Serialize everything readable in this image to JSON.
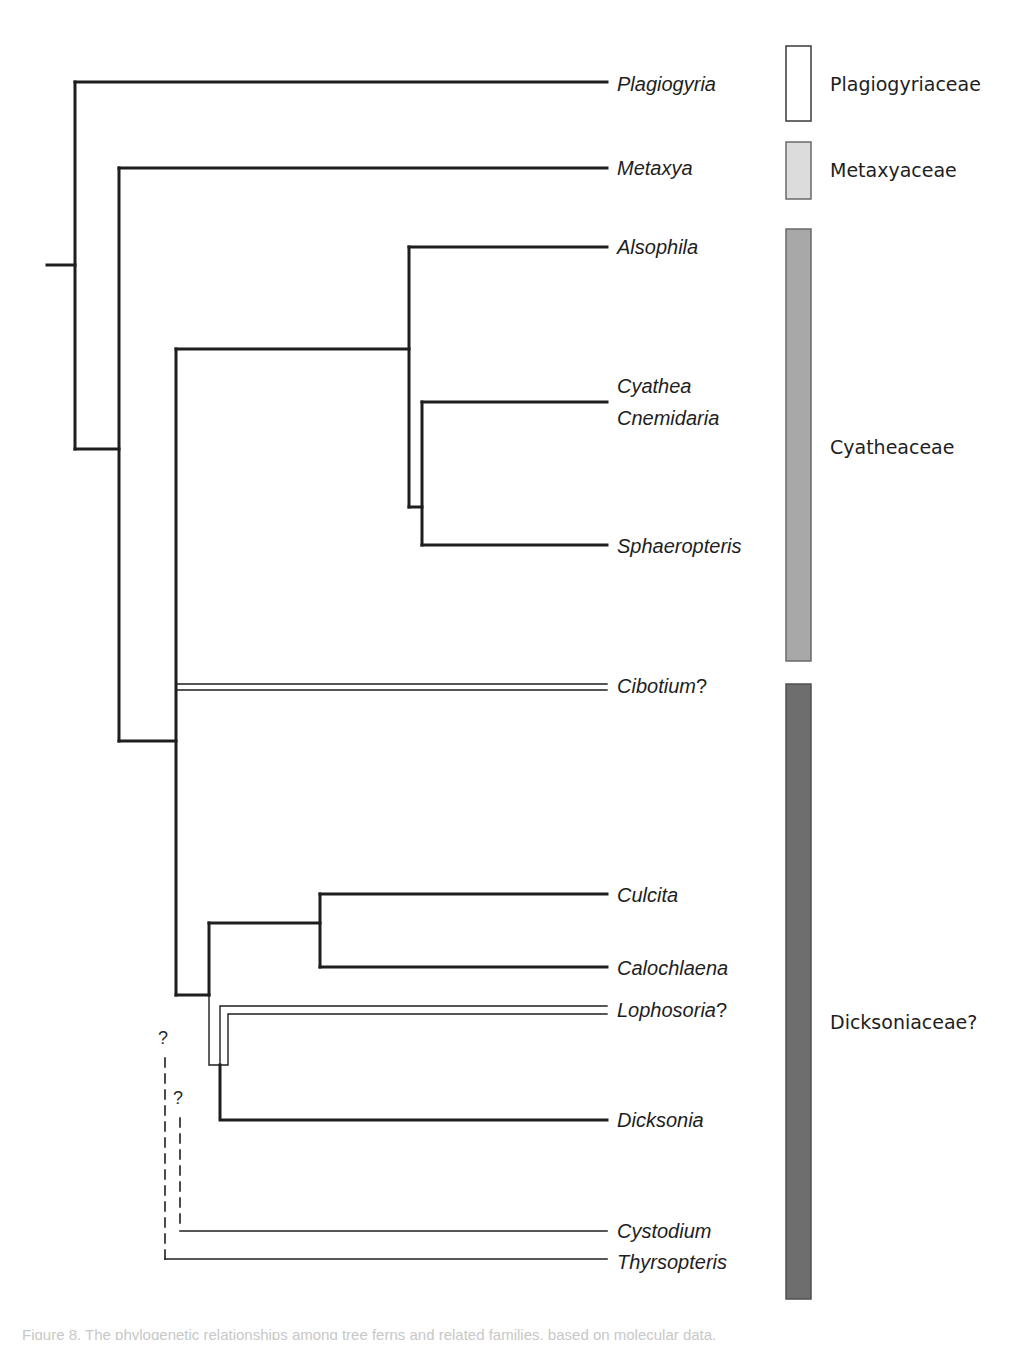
{
  "figure": {
    "type": "phylogenetic-tree",
    "line_color": "#1e1e1e",
    "background": "#ffffff"
  },
  "taxa": [
    {
      "id": "plagiogyria",
      "label": "Plagiogyria",
      "y": 84,
      "line_style": "solid-thick"
    },
    {
      "id": "metaxya",
      "label": "Metaxya",
      "y": 168,
      "line_style": "solid-thick"
    },
    {
      "id": "alsophila",
      "label": "Alsophila",
      "y": 247,
      "line_style": "solid-thick"
    },
    {
      "id": "cyathea",
      "label": "Cyathea",
      "y": 386,
      "line_style": "solid-thick"
    },
    {
      "id": "cnemidaria",
      "label": "Cnemidaria",
      "y": 418,
      "line_style": "none"
    },
    {
      "id": "sphaeropteris",
      "label": "Sphaeropteris",
      "y": 546,
      "line_style": "solid-thick"
    },
    {
      "id": "cibotium",
      "label": "Cibotium",
      "suffix": "?",
      "y": 686,
      "line_style": "double"
    },
    {
      "id": "culcita",
      "label": "Culcita",
      "y": 895,
      "line_style": "solid-thick"
    },
    {
      "id": "calochlaena",
      "label": "Calochlaena",
      "y": 968,
      "line_style": "solid-thick"
    },
    {
      "id": "lophosoria",
      "label": "Lophosoria",
      "suffix": "?",
      "y": 1010,
      "line_style": "double"
    },
    {
      "id": "dicksonia",
      "label": "Dicksonia",
      "y": 1120,
      "line_style": "solid-thick"
    },
    {
      "id": "cystodium",
      "label": "Cystodium",
      "y": 1231,
      "line_style": "solid-thin"
    },
    {
      "id": "thyrsopteris",
      "label": "Thyrsopteris",
      "y": 1262,
      "line_style": "solid-thin"
    }
  ],
  "uncertain_marks": [
    {
      "label": "?",
      "x": 158,
      "y": 1044
    },
    {
      "label": "?",
      "x": 173,
      "y": 1104
    }
  ],
  "families": [
    {
      "label": "Plagiogyriaceae",
      "y_top": 46,
      "y_bottom": 121,
      "fill": "#ffffff",
      "stroke": "#3a3a3a",
      "label_y": 84
    },
    {
      "label": "Metaxyaceae",
      "y_top": 142,
      "y_bottom": 199,
      "fill": "#dcdcdc",
      "stroke": "#6a6a6a",
      "label_y": 170
    },
    {
      "label": "Cyatheaceae",
      "y_top": 229,
      "y_bottom": 661,
      "fill": "#a8a8a8",
      "stroke": "#6a6a6a",
      "label_y": 447
    },
    {
      "label": "Dicksoniaceae?",
      "y_top": 684,
      "y_bottom": 1299,
      "fill": "#6e6e6e",
      "stroke": "#505050",
      "label_y": 1022
    }
  ],
  "caption": {
    "text": "Figure 8. The phylogenetic relationships among tree ferns and related families, based on molecular data."
  }
}
